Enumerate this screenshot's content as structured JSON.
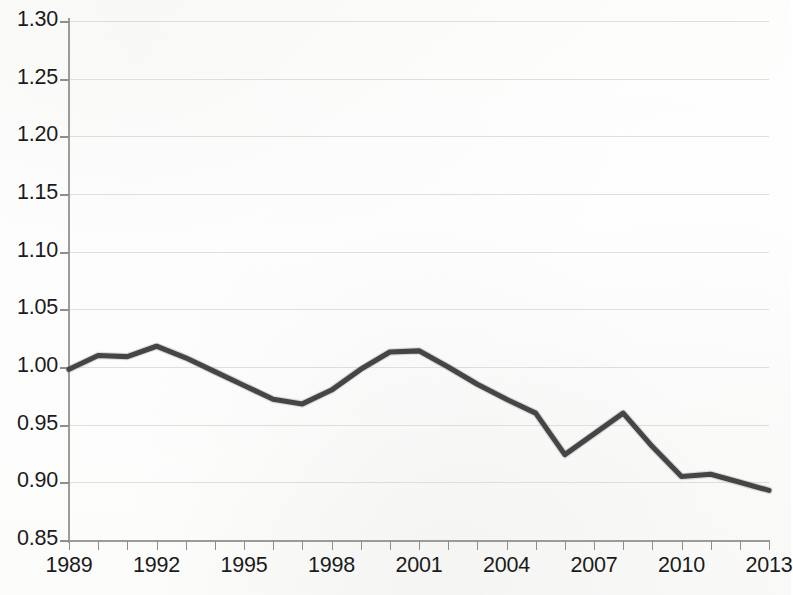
{
  "chart_data": {
    "type": "line",
    "title": "",
    "subtitle": "",
    "xlabel": "",
    "ylabel": "",
    "xlim": [
      1989,
      2013
    ],
    "ylim": [
      0.85,
      1.3
    ],
    "grid": true,
    "legend": false,
    "legend_position": "none",
    "line_color": "#454545",
    "background_color": "#fdfdfc",
    "gridline_color": "#dededa",
    "axis_color": "#9b9b97",
    "y_ticks": [
      0.85,
      0.9,
      0.95,
      1.0,
      1.05,
      1.1,
      1.15,
      1.2,
      1.25,
      1.3
    ],
    "y_tick_labels": [
      "0.85",
      "0.90",
      "0.95",
      "1.00",
      "1.05",
      "1.10",
      "1.15",
      "1.20",
      "1.25",
      "1.30"
    ],
    "x_ticks": [
      1989,
      1990,
      1991,
      1992,
      1993,
      1994,
      1995,
      1996,
      1997,
      1998,
      1999,
      2000,
      2001,
      2002,
      2003,
      2004,
      2005,
      2006,
      2007,
      2008,
      2009,
      2010,
      2011,
      2012,
      2013
    ],
    "x_tick_labels_shown": [
      "1989",
      "1992",
      "1995",
      "1998",
      "2001",
      "2004",
      "2007",
      "2010",
      "2013"
    ],
    "x_labeled_years": [
      1989,
      1992,
      1995,
      1998,
      2001,
      2004,
      2007,
      2010,
      2013
    ],
    "x": [
      1989,
      1990,
      1991,
      1992,
      1993,
      1994,
      1995,
      1996,
      1997,
      1998,
      1999,
      2000,
      2001,
      2002,
      2003,
      2004,
      2005,
      2006,
      2007,
      2008,
      2009,
      2010,
      2011,
      2012,
      2013
    ],
    "values": [
      0.998,
      1.01,
      1.009,
      1.018,
      1.008,
      0.996,
      0.984,
      0.972,
      0.968,
      0.98,
      0.998,
      1.013,
      1.014,
      1.0,
      0.985,
      0.972,
      0.96,
      0.924,
      0.942,
      0.96,
      0.931,
      0.905,
      0.907,
      0.9,
      0.893
    ],
    "categories": [
      "1989",
      "1990",
      "1991",
      "1992",
      "1993",
      "1994",
      "1995",
      "1996",
      "1997",
      "1998",
      "1999",
      "2000",
      "2001",
      "2002",
      "2003",
      "2004",
      "2005",
      "2006",
      "2007",
      "2008",
      "2009",
      "2010",
      "2011",
      "2012",
      "2013"
    ],
    "series": [
      {
        "name": "index",
        "values": [
          0.998,
          1.01,
          1.009,
          1.018,
          1.008,
          0.996,
          0.984,
          0.972,
          0.968,
          0.98,
          0.998,
          1.013,
          1.014,
          1.0,
          0.985,
          0.972,
          0.96,
          0.924,
          0.942,
          0.96,
          0.931,
          0.905,
          0.907,
          0.9,
          0.893
        ]
      }
    ],
    "annotations": []
  }
}
